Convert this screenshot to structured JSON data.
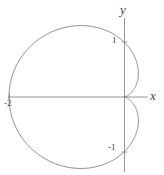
{
  "figure": {
    "background_color": "#ffffff",
    "curve_color": "#7d7d7d",
    "axis_color": "#8a8a8a",
    "text_color": "#3f3f3f"
  },
  "axes": {
    "x_axis_label": "x",
    "y_axis_label": "y",
    "origin_px": {
      "x": 124,
      "y": 97
    },
    "x_axis_span_px": {
      "from": 8,
      "to": 148
    },
    "y_axis_span_px": {
      "from": 18,
      "to": 172
    },
    "units_per_pixel_x": 57.5,
    "units_per_pixel_y": 55
  },
  "tick_labels": {
    "y_positive_one": "1",
    "y_negative_one": "-1",
    "x_negative_two": "-2"
  },
  "chart_data": {
    "type": "line",
    "title": "",
    "subtitle": "",
    "xlabel": "x",
    "ylabel": "y",
    "plot_style": "polar curve drawn on cartesian axes",
    "equation_polar": "r = 1 - cos(theta)",
    "curve_name": "cardioid",
    "orientation": "cusp at origin opening toward negative x",
    "grid": false,
    "legend": null,
    "xlim": [
      -2.05,
      0.42
    ],
    "ylim": [
      -1.32,
      1.32
    ],
    "xtick_values": [
      -2
    ],
    "xtick_labels": [
      "-2"
    ],
    "ytick_values": [
      1,
      -1
    ],
    "ytick_labels": [
      "1",
      "-1"
    ],
    "key_points": [
      {
        "label": "cusp",
        "theta_deg": 0,
        "x": 0,
        "y": 0
      },
      {
        "label": "upper extreme",
        "theta_deg": 90,
        "x": 0,
        "y": 1
      },
      {
        "label": "leftmost",
        "theta_deg": 180,
        "x": -2,
        "y": 0
      },
      {
        "label": "lower extreme",
        "theta_deg": 270,
        "x": 0,
        "y": -1
      },
      {
        "label": "top of lobe",
        "theta_deg": 120,
        "x": -0.75,
        "y": 1.3
      },
      {
        "label": "bottom of lobe",
        "theta_deg": 240,
        "x": -0.75,
        "y": -1.3
      },
      {
        "label": "right bulge upper",
        "theta_deg": 60,
        "x": 0.25,
        "y": 0.43
      },
      {
        "label": "right bulge lower",
        "theta_deg": 300,
        "x": 0.25,
        "y": -0.43
      }
    ],
    "x": [
      0,
      0.033,
      0.125,
      0.25,
      0.375,
      0.464,
      0.5,
      0.464,
      0.375,
      0.25,
      0.125,
      0,
      -0.17,
      -0.375,
      -0.6,
      -0.824,
      -1.0,
      -1.22,
      -1.45,
      -1.65,
      -1.82,
      -1.93,
      -1.98,
      -2.0,
      -1.98,
      -1.93,
      -1.82,
      -1.65,
      -1.45,
      -1.22,
      -1.0,
      -0.824,
      -0.6,
      -0.375,
      -0.17,
      0,
      0.125,
      0.25,
      0.375,
      0.464,
      0.5,
      0.464,
      0.375,
      0.25,
      0.125,
      0.033,
      0
    ],
    "y": [
      0,
      0.116,
      0.217,
      0.325,
      0.415,
      0.464,
      0.5,
      0.536,
      0.585,
      0.65,
      0.72,
      0.8,
      0.9,
      1.0,
      1.1,
      1.2,
      1.25,
      1.29,
      1.3,
      1.28,
      1.2,
      1.05,
      0.85,
      0,
      -0.85,
      -1.05,
      -1.2,
      -1.28,
      -1.3,
      -1.29,
      -1.25,
      -1.2,
      -1.1,
      -1.0,
      -0.9,
      -0.8,
      -0.72,
      -0.65,
      -0.585,
      -0.536,
      -0.5,
      -0.464,
      -0.415,
      -0.325,
      -0.217,
      -0.116,
      0
    ]
  }
}
